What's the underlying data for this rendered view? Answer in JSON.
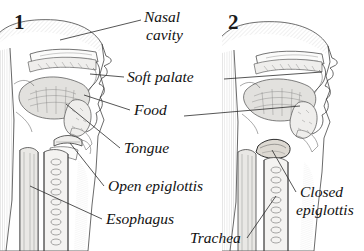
{
  "figure": {
    "background_color": "#ffffff",
    "ink_color": "#3a3a3a",
    "label_color": "#111111"
  },
  "panels": [
    {
      "number": "1",
      "caption_state": "Open epiglottis"
    },
    {
      "number": "2",
      "caption_state": "Closed epiglottis"
    }
  ],
  "labels": {
    "nasal_cavity_line1": "Nasal",
    "nasal_cavity_line2": "cavity",
    "soft_palate": "Soft palate",
    "food": "Food",
    "tongue": "Tongue",
    "open_epiglottis": "Open epiglottis",
    "esophagus": "Esophagus",
    "trachea": "Trachea",
    "closed_epiglottis_line1": "Closed",
    "closed_epiglottis_line2": "epiglottis"
  }
}
